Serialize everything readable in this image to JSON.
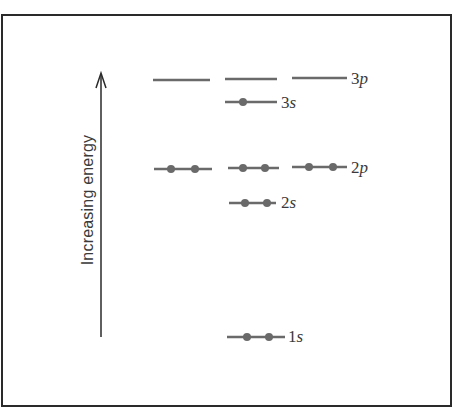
{
  "diagram": {
    "type": "orbital-energy-level-diagram",
    "axis": {
      "label": "Increasing energy",
      "direction": "up"
    },
    "colors": {
      "line": "#6a6a6a",
      "electron": "#6a6a6a",
      "border": "#2a2a2a",
      "text": "#3a3a3a"
    },
    "levels": [
      {
        "id": "3p",
        "n": "3",
        "l": "p",
        "orbitals": [
          {
            "x1": 153,
            "x2": 210,
            "y": 80,
            "electrons": []
          },
          {
            "x1": 225,
            "x2": 277,
            "y": 79,
            "electrons": []
          },
          {
            "x1": 292,
            "x2": 347,
            "y": 78,
            "electrons": []
          }
        ],
        "label_pos": {
          "x": 351,
          "y": 70
        }
      },
      {
        "id": "3s",
        "n": "3",
        "l": "s",
        "orbitals": [
          {
            "x1": 225,
            "x2": 277,
            "y": 102,
            "electrons": [
              243
            ]
          }
        ],
        "label_pos": {
          "x": 281,
          "y": 94
        }
      },
      {
        "id": "2p",
        "n": "2",
        "l": "p",
        "orbitals": [
          {
            "x1": 154,
            "x2": 212,
            "y": 169,
            "electrons": [
              171,
              195
            ]
          },
          {
            "x1": 228,
            "x2": 279,
            "y": 168,
            "electrons": [
              243,
              265
            ]
          },
          {
            "x1": 292,
            "x2": 347,
            "y": 167,
            "electrons": [
              309,
              333
            ]
          }
        ],
        "label_pos": {
          "x": 351,
          "y": 159
        }
      },
      {
        "id": "2s",
        "n": "2",
        "l": "s",
        "orbitals": [
          {
            "x1": 229,
            "x2": 276,
            "y": 203,
            "electrons": [
              245,
              267
            ]
          }
        ],
        "label_pos": {
          "x": 281,
          "y": 194
        }
      },
      {
        "id": "1s",
        "n": "1",
        "l": "s",
        "orbitals": [
          {
            "x1": 227,
            "x2": 285,
            "y": 337,
            "electrons": [
              247,
              269
            ]
          }
        ],
        "label_pos": {
          "x": 288,
          "y": 328
        }
      }
    ],
    "labels": {
      "3p": {
        "n": "3",
        "l": "p"
      },
      "3s": {
        "n": "3",
        "l": "s"
      },
      "2p": {
        "n": "2",
        "l": "p"
      },
      "2s": {
        "n": "2",
        "l": "s"
      },
      "1s": {
        "n": "1",
        "l": "s"
      }
    }
  }
}
